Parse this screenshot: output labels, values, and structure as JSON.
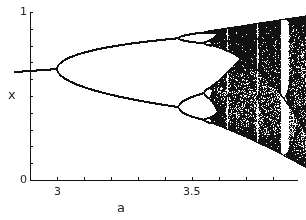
{
  "chart_data": {
    "type": "scatter",
    "title": "",
    "subtitle": "Bifurcation diagram of the logistic map x_{n+1} = a x_n (1 - x_n)",
    "xlabel": "a",
    "ylabel": "x",
    "xlim": [
      2.84,
      4.0
    ],
    "ylim": [
      0,
      1
    ],
    "x_ticks": [
      2.9,
      3.0,
      3.1,
      3.2,
      3.3,
      3.4,
      3.5,
      3.6,
      3.7,
      3.8,
      3.9,
      4.0
    ],
    "x_tick_labels": [
      {
        "value": 3.0,
        "label": "3"
      },
      {
        "value": 3.5,
        "label": "3.5"
      }
    ],
    "y_ticks": [
      0,
      0.1,
      0.2,
      0.3,
      0.4,
      0.5,
      0.6,
      0.7,
      0.8,
      0.9,
      1.0
    ],
    "y_tick_labels": [
      {
        "value": 0,
        "label": "0"
      },
      {
        "value": 1,
        "label": "1"
      }
    ],
    "grid": false,
    "legend": null,
    "series": [
      {
        "name": "attractor x(a)",
        "map": "logistic",
        "a_range": [
          2.84,
          3.99
        ],
        "key_points": [
          {
            "a": 2.84,
            "x": [
              0.648
            ]
          },
          {
            "a": 3.0,
            "x": [
              0.667
            ]
          },
          {
            "a": 3.2,
            "x": [
              0.513,
              0.799
            ]
          },
          {
            "a": 3.449,
            "x": [
              0.44,
              0.852
            ]
          },
          {
            "a": 3.5,
            "x": [
              0.383,
              0.501,
              0.827,
              0.875
            ]
          },
          {
            "a": 3.57,
            "note": "onset of chaos"
          },
          {
            "a": 3.83,
            "note": "period-3 window"
          },
          {
            "a": 3.99,
            "x_range": [
              0.01,
              0.9975
            ]
          }
        ]
      }
    ],
    "color": "#111111"
  },
  "axes": {
    "x_axis_label": "a",
    "y_axis_label": "x",
    "x_label_3": "3",
    "x_label_35": "3.5",
    "y_label_0": "0",
    "y_label_1": "1"
  }
}
